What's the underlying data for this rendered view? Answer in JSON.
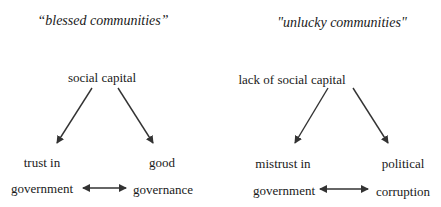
{
  "diagram": {
    "colors": {
      "background": "#ffffff",
      "text": "#1a1a1a",
      "arrow": "#333333"
    },
    "left": {
      "title": "“blessed communities”",
      "root": "social capital",
      "outcome_left_line1": "trust in",
      "outcome_left_line2": "government",
      "outcome_right_line1": "good",
      "outcome_right_line2": "governance",
      "relation": "bidirectional"
    },
    "right": {
      "title": "\"unlucky communities\"",
      "root": "lack of social capital",
      "outcome_left_line1": "mistrust in",
      "outcome_left_line2": "government",
      "outcome_right_line1": "political",
      "outcome_right_line2": "corruption",
      "relation": "bidirectional"
    },
    "edges": [
      {
        "from": "social capital",
        "to": "trust in government",
        "type": "directed"
      },
      {
        "from": "social capital",
        "to": "good governance",
        "type": "directed"
      },
      {
        "from": "trust in government",
        "to": "good governance",
        "type": "bidirectional"
      },
      {
        "from": "lack of social capital",
        "to": "mistrust in government",
        "type": "directed"
      },
      {
        "from": "lack of social capital",
        "to": "political corruption",
        "type": "directed"
      },
      {
        "from": "mistrust in government",
        "to": "political corruption",
        "type": "bidirectional"
      }
    ]
  }
}
